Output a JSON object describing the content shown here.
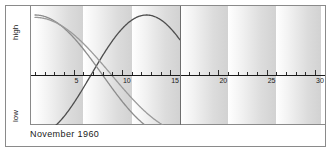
{
  "footer": {
    "date_label": "November 1960"
  },
  "axis": {
    "y_high_label": "high",
    "y_low_label": "low",
    "tick_labels": [
      "5",
      "10",
      "15",
      "20",
      "25",
      "30"
    ]
  },
  "colors": {
    "frame": "#8a8a8a",
    "axis": "#1a1a1a",
    "today_line": "#6e6e6e",
    "curve_physical": "#4d4d4d",
    "curve_emotional": "#8c8c8c",
    "curve_intellectual": "#9a9a9a",
    "band_light": "#ffffff",
    "band_dark": "#d2d2d2"
  },
  "chart_data": {
    "type": "line",
    "title": "",
    "subtitle": "",
    "xlabel": "",
    "ylabel": "",
    "xlim": [
      1,
      30
    ],
    "ylim": [
      -1,
      1
    ],
    "grid": false,
    "legend": "none",
    "xticks": [
      5,
      10,
      15,
      20,
      25,
      30
    ],
    "yticks": [
      -1,
      0,
      1
    ],
    "ytick_labels": [
      "low",
      "",
      "high"
    ],
    "annotations": [
      {
        "label": "November 1960",
        "position": "footer"
      },
      {
        "label": "today-marker",
        "x": 16
      }
    ],
    "band_period_days": 5,
    "data_end_x": 16,
    "series": [
      {
        "name": "physical",
        "period_days": 23,
        "phase_days": 17.2,
        "x": [
          1,
          2,
          3,
          4,
          5,
          6,
          7,
          8,
          9,
          10,
          11,
          12,
          13,
          14,
          15,
          16
        ],
        "values": [
          -0.97,
          -0.88,
          -0.73,
          -0.53,
          -0.29,
          -0.03,
          0.23,
          0.48,
          0.69,
          0.86,
          0.96,
          1.0,
          0.96,
          0.86,
          0.69,
          0.48
        ]
      },
      {
        "name": "emotional",
        "period_days": 28,
        "phase_days": 0.0,
        "x": [
          1,
          2,
          3,
          4,
          5,
          6,
          7,
          8,
          9,
          10,
          11,
          12,
          13,
          14,
          15,
          16
        ],
        "values": [
          1.0,
          0.97,
          0.87,
          0.72,
          0.52,
          0.28,
          0.02,
          -0.22,
          -0.46,
          -0.66,
          -0.82,
          -0.93,
          -0.99,
          -1.0,
          -0.95,
          -0.85
        ]
      },
      {
        "name": "intellectual",
        "period_days": 33,
        "phase_days": 0.0,
        "x": [
          1,
          2,
          3,
          4,
          5,
          6,
          7,
          8,
          9,
          10,
          11,
          12,
          13,
          14,
          15,
          16
        ],
        "values": [
          0.92,
          0.8,
          0.65,
          0.46,
          0.25,
          0.03,
          -0.19,
          -0.41,
          -0.6,
          -0.76,
          -0.89,
          -0.97,
          -1.0,
          -0.97,
          -0.89,
          -0.7
        ]
      }
    ]
  }
}
